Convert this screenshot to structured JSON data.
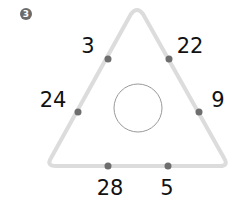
{
  "problem": {
    "number_badge": "3",
    "numbers": {
      "top_left": "3",
      "top_right": "22",
      "left": "24",
      "right": "9",
      "bottom_left": "28",
      "bottom_right": "5"
    },
    "center_circle_value": ""
  },
  "colors": {
    "triangle_stroke": "#dcdcdc",
    "dot": "#6e6e6e",
    "circle_stroke": "#9a9a9a",
    "badge": "#6b6b6b"
  }
}
